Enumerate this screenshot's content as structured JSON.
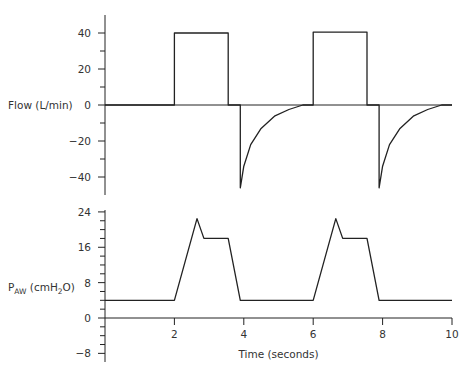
{
  "chart_data": [
    {
      "type": "line",
      "title": "",
      "ylabel": "Flow (L/min)",
      "xlabel": "",
      "ylim": [
        -50,
        50
      ],
      "yticks_labeled": [
        40,
        20,
        0,
        -20,
        -40
      ],
      "yticks_minor": [
        30,
        10,
        -10,
        -30
      ],
      "xlim": [
        0,
        10
      ],
      "grid": false,
      "series": [
        {
          "name": "Flow",
          "points": [
            [
              0,
              0
            ],
            [
              2,
              0
            ],
            [
              2,
              40
            ],
            [
              3.55,
              40
            ],
            [
              3.55,
              0
            ],
            [
              3.9,
              0
            ],
            [
              3.9,
              -46
            ],
            [
              4.0,
              -34
            ],
            [
              4.2,
              -22
            ],
            [
              4.5,
              -13
            ],
            [
              4.9,
              -6
            ],
            [
              5.3,
              -2.5
            ],
            [
              5.7,
              0
            ],
            [
              6,
              0
            ],
            [
              6,
              40.5
            ],
            [
              7.55,
              40.5
            ],
            [
              7.55,
              0
            ],
            [
              7.9,
              0
            ],
            [
              7.9,
              -46
            ],
            [
              8.0,
              -34
            ],
            [
              8.2,
              -22
            ],
            [
              8.5,
              -13
            ],
            [
              8.9,
              -6
            ],
            [
              9.3,
              -2.5
            ],
            [
              9.7,
              0
            ],
            [
              10,
              0
            ]
          ]
        }
      ]
    },
    {
      "type": "line",
      "title": "",
      "ylabel": "P_AW (cmH2O)",
      "ylabel_main": "P",
      "ylabel_sub": "AW",
      "ylabel_rest_pre": " (cmH",
      "ylabel_rest_sub": "2",
      "ylabel_rest_post": "O)",
      "xlabel": "Time (seconds)",
      "ylim": [
        -10,
        26
      ],
      "yticks_labeled": [
        24,
        16,
        8,
        0,
        -8
      ],
      "yticks_minor": [
        22,
        20,
        18,
        14,
        12,
        10,
        6,
        4,
        2,
        -2,
        -4,
        -6
      ],
      "xlim": [
        0,
        10
      ],
      "xticks": [
        2,
        4,
        6,
        8,
        10
      ],
      "grid": false,
      "series": [
        {
          "name": "Airway pressure",
          "points": [
            [
              0,
              4
            ],
            [
              2,
              4
            ],
            [
              2.65,
              22.5
            ],
            [
              2.85,
              18
            ],
            [
              3.55,
              18
            ],
            [
              3.9,
              4
            ],
            [
              6,
              4
            ],
            [
              6.65,
              22.5
            ],
            [
              6.85,
              18
            ],
            [
              7.55,
              18
            ],
            [
              7.9,
              4
            ],
            [
              10,
              4
            ]
          ]
        }
      ]
    }
  ],
  "layout": {
    "x0": 105,
    "xscale": 34.7,
    "flow": {
      "y0": 105,
      "yscale": 1.8,
      "axis_top": 15,
      "axis_bottom": 195
    },
    "paw": {
      "y0": 318,
      "yscale": 4.42,
      "axis_top": 210,
      "axis_bottom": 362
    },
    "line_color": "#222222"
  }
}
